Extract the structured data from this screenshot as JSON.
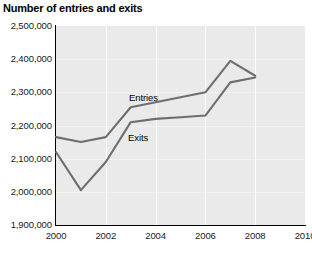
{
  "chart_data": {
    "type": "line",
    "title": "Number of entries and exits",
    "xlabel": "",
    "ylabel": "",
    "x": [
      2000,
      2001,
      2002,
      2003,
      2004,
      2005,
      2006,
      2007,
      2008
    ],
    "xlim": [
      2000,
      2010
    ],
    "ylim": [
      1900000,
      2500000
    ],
    "xticks": [
      2000,
      2002,
      2004,
      2006,
      2008,
      2010
    ],
    "xtick_labels": [
      "2000",
      "2002",
      "2004",
      "2006",
      "2008",
      "2010"
    ],
    "yticks": [
      1900000,
      2000000,
      2100000,
      2200000,
      2300000,
      2400000,
      2500000
    ],
    "ytick_labels": [
      "1,900,000",
      "2,000,000",
      "2,100,000",
      "2,200,000",
      "2,300,000",
      "2,400,000",
      "2,500,000"
    ],
    "grid": "vertical-and-horizontal",
    "legend_position": "inline-annotations",
    "series": [
      {
        "name": "Entries",
        "label_text": "Entries",
        "color": "#6e6e6e",
        "values": [
          2165000,
          2150000,
          2165000,
          2255000,
          2270000,
          2285000,
          2300000,
          2395000,
          2350000
        ]
      },
      {
        "name": "Exits",
        "label_text": "Exits",
        "color": "#6e6e6e",
        "values": [
          2120000,
          2005000,
          2090000,
          2210000,
          2220000,
          2225000,
          2230000,
          2330000,
          2345000
        ]
      }
    ],
    "plot_background": "#eaeaea",
    "gridline_color": "#ffffff",
    "axis_color": "#000000"
  }
}
